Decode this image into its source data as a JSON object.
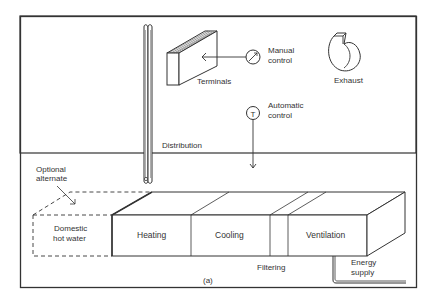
{
  "figure": {
    "caption": "(a)",
    "labels": {
      "terminals": "Terminals",
      "manual_control_1": "Manual",
      "manual_control_2": "control",
      "exhaust": "Exhaust",
      "automatic_control_1": "Automatic",
      "automatic_control_2": "control",
      "distribution": "Distribution",
      "optional_alternate_1": "Optional",
      "optional_alternate_2": "alternate",
      "domestic_hot_water_1": "Domestic",
      "domestic_hot_water_2": "hot water",
      "heating": "Heating",
      "cooling": "Cooling",
      "ventilation": "Ventilation",
      "filtering": "Filtering",
      "energy_supply_1": "Energy",
      "energy_supply_2": "supply"
    },
    "symbols": {
      "thermostat": "T"
    },
    "colors": {
      "line": "#333333",
      "background": "#ffffff"
    }
  }
}
